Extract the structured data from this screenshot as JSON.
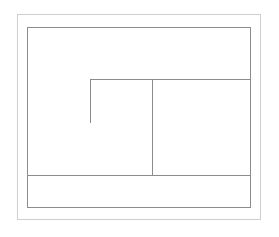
{
  "canvas": {
    "width": 279,
    "height": 237,
    "background": "#ffffff"
  },
  "colors": {
    "outer_border": "#cfcfcf",
    "inner_border": "#8c8c8c",
    "divider": "#8c8c8c"
  },
  "outer_frame": {
    "x": 17,
    "y": 14,
    "w": 244,
    "h": 206
  },
  "inner_frame": {
    "x": 27,
    "y": 27,
    "w": 224,
    "h": 181
  },
  "segments": [
    {
      "name": "upper-horizontal-line",
      "orientation": "h",
      "x": 90,
      "y": 79,
      "length": 160
    },
    {
      "name": "l-shape-vertical-line",
      "orientation": "v",
      "x": 90,
      "y": 79,
      "length": 44
    },
    {
      "name": "center-vertical-divider",
      "orientation": "v",
      "x": 152,
      "y": 79,
      "length": 96
    },
    {
      "name": "footer-horizontal-divider",
      "orientation": "h",
      "x": 27,
      "y": 175,
      "length": 223
    }
  ]
}
